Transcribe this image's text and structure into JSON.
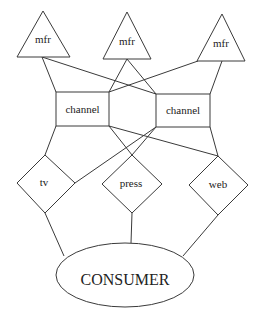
{
  "diagram": {
    "manufacturers": [
      {
        "id": "mfr1",
        "label": "mfr"
      },
      {
        "id": "mfr2",
        "label": "mfr"
      },
      {
        "id": "mfr3",
        "label": "mfr"
      }
    ],
    "channels": [
      {
        "id": "ch1",
        "label": "channel"
      },
      {
        "id": "ch2",
        "label": "channel"
      }
    ],
    "media": [
      {
        "id": "tv",
        "label": "tv"
      },
      {
        "id": "press",
        "label": "press"
      },
      {
        "id": "web",
        "label": "web"
      }
    ],
    "consumer": {
      "label": "CONSUMER"
    },
    "edges": [
      [
        "mfr1",
        "ch1"
      ],
      [
        "mfr1",
        "ch2"
      ],
      [
        "mfr2",
        "ch1"
      ],
      [
        "mfr2",
        "ch2"
      ],
      [
        "mfr3",
        "ch1"
      ],
      [
        "mfr3",
        "ch2"
      ],
      [
        "ch1",
        "tv"
      ],
      [
        "ch1",
        "press"
      ],
      [
        "ch1",
        "web"
      ],
      [
        "ch2",
        "tv"
      ],
      [
        "ch2",
        "press"
      ],
      [
        "ch2",
        "web"
      ],
      [
        "tv",
        "consumer"
      ],
      [
        "press",
        "consumer"
      ],
      [
        "web",
        "consumer"
      ]
    ]
  }
}
